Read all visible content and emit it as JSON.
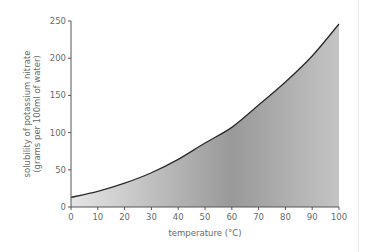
{
  "chart_data": {
    "type": "area",
    "title": "",
    "xlabel": "temperature (°C)",
    "ylabel_line1": "solubility of potassium nitrate",
    "ylabel_line2": "(grams per 100ml of water)",
    "x": [
      0,
      10,
      20,
      30,
      40,
      50,
      60,
      70,
      80,
      90,
      100
    ],
    "series": [
      {
        "name": "solubility of potassium nitrate",
        "values": [
          13,
          21,
          32,
          46,
          64,
          86,
          107,
          137,
          168,
          203,
          246
        ]
      }
    ],
    "xlim": [
      0,
      100
    ],
    "ylim": [
      0,
      250
    ],
    "x_ticks": [
      0,
      10,
      20,
      30,
      40,
      50,
      60,
      70,
      80,
      90,
      100
    ],
    "y_ticks": [
      0,
      50,
      100,
      150,
      200,
      250
    ],
    "grid": false,
    "legend": "none",
    "colors": {
      "line": "#2b2b2b",
      "fill_light": "#e4e4e4",
      "fill_dark": "#9a9a9a",
      "axis": "#555555",
      "text": "#6a6a6a"
    }
  }
}
